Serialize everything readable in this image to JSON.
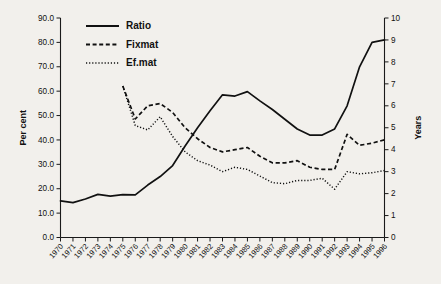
{
  "chart_data": {
    "type": "line",
    "title": "",
    "xlabel": "",
    "ylabel": "Per cent",
    "y2label": "Years",
    "grid": false,
    "legend_position": "top-left",
    "xlim": [
      1970,
      1996
    ],
    "ylim": [
      0,
      90
    ],
    "y2lim": [
      0,
      10
    ],
    "ytick_labels": [
      "0.0",
      "10.0",
      "20.0",
      "30.0",
      "40.0",
      "50.0",
      "60.0",
      "70.0",
      "80.0",
      "90.0"
    ],
    "ytick_values": [
      0,
      10,
      20,
      30,
      40,
      50,
      60,
      70,
      80,
      90
    ],
    "y2tick_labels": [
      "0",
      "1",
      "2",
      "3",
      "4",
      "5",
      "6",
      "7",
      "8",
      "9",
      "10"
    ],
    "y2tick_values": [
      0,
      1,
      2,
      3,
      4,
      5,
      6,
      7,
      8,
      9,
      10
    ],
    "categories": [
      "1970",
      "1971",
      "1972",
      "1973",
      "1974",
      "1975",
      "1976",
      "1977",
      "1978",
      "1979",
      "1980",
      "1981",
      "1982",
      "1983",
      "1984",
      "1985",
      "1986",
      "1987",
      "1988",
      "1989",
      "1990",
      "1991",
      "1992",
      "1993",
      "1994",
      "1995",
      "1996"
    ],
    "series": [
      {
        "name": "Ratio",
        "axis": "left",
        "style": "solid",
        "unit": "per cent",
        "x": [
          1970,
          1971,
          1972,
          1973,
          1974,
          1975,
          1976,
          1977,
          1978,
          1979,
          1980,
          1981,
          1982,
          1983,
          1984,
          1985,
          1986,
          1987,
          1988,
          1989,
          1990,
          1991,
          1992,
          1993,
          1994,
          1995,
          1996
        ],
        "values": [
          15.0,
          14.3,
          15.8,
          17.7,
          17.0,
          17.6,
          17.5,
          21.5,
          25.0,
          29.5,
          37.5,
          45.0,
          52.0,
          58.5,
          58.0,
          59.8,
          56.0,
          52.5,
          48.5,
          44.5,
          42.0,
          42.0,
          44.5,
          54.0,
          70.0,
          80.0,
          81.0
        ]
      },
      {
        "name": "Fixmat",
        "axis": "right",
        "style": "dashed",
        "unit": "years",
        "x": [
          1975,
          1976,
          1977,
          1978,
          1979,
          1980,
          1981,
          1982,
          1983,
          1984,
          1985,
          1986,
          1987,
          1988,
          1989,
          1990,
          1991,
          1992,
          1993,
          1994,
          1995,
          1996
        ],
        "values": [
          6.9,
          5.4,
          6.0,
          6.1,
          5.7,
          5.0,
          4.5,
          4.1,
          3.9,
          4.0,
          4.1,
          3.7,
          3.4,
          3.4,
          3.5,
          3.2,
          3.1,
          3.1,
          4.7,
          4.2,
          4.3,
          4.45
        ]
      },
      {
        "name": "Ef.mat",
        "axis": "right",
        "style": "dotted",
        "unit": "years",
        "x": [
          1975,
          1976,
          1977,
          1978,
          1979,
          1980,
          1981,
          1982,
          1983,
          1984,
          1985,
          1986,
          1987,
          1988,
          1989,
          1990,
          1991,
          1992,
          1993,
          1994,
          1995,
          1996
        ],
        "values": [
          6.9,
          5.1,
          4.9,
          5.5,
          4.6,
          3.9,
          3.5,
          3.3,
          3.0,
          3.2,
          3.1,
          2.8,
          2.5,
          2.45,
          2.6,
          2.6,
          2.7,
          2.2,
          3.0,
          2.9,
          2.95,
          3.05
        ]
      }
    ],
    "legend": [
      {
        "label": "Ratio",
        "style": "solid"
      },
      {
        "label": "Fixmat",
        "style": "dashed"
      },
      {
        "label": "Ef.mat",
        "style": "dotted"
      }
    ]
  }
}
